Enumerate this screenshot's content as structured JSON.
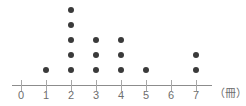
{
  "chart_data": {
    "type": "scatter",
    "plot_style": "dot-plot",
    "title": "",
    "subtitle": "",
    "xlabel": "",
    "ylabel": "",
    "unit_label": "（冊）",
    "categories": [
      "0",
      "1",
      "2",
      "3",
      "4",
      "5",
      "6",
      "7"
    ],
    "x": [
      0,
      1,
      2,
      3,
      4,
      5,
      6,
      7
    ],
    "values": [
      0,
      1,
      5,
      3,
      3,
      1,
      0,
      2
    ],
    "total_count": 15,
    "xlim": [
      0,
      7
    ],
    "ylim": [
      0,
      5
    ],
    "tick_labels": [
      "0",
      "1",
      "2",
      "3",
      "4",
      "5",
      "6",
      "7"
    ],
    "grid": false,
    "legend": null,
    "annotations": [],
    "colors": {
      "dot": "#3a3a3a",
      "axis": "#8c8c8c",
      "tick": "#a8a8a8",
      "label": "#6e6e6e",
      "background": "#ffffff"
    },
    "geometry": {
      "axis_left_px": 12,
      "axis_right_px": 212,
      "axis_y_px": 85,
      "origin_x_px": 21,
      "step_px": 25,
      "baseline_dot_y_px": 70,
      "dot_spacing_y_px": 15
    }
  }
}
